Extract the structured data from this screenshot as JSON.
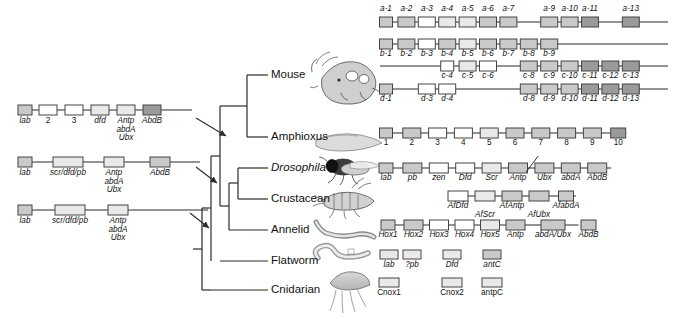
{
  "figure": {
    "colors": {
      "line": "#2b2b2b",
      "box_stroke": "#444444",
      "box_fill_light": "#ffffff",
      "box_fill_pale": "#e9e9e9",
      "box_fill_mid": "#c9c9c9",
      "box_fill_dark": "#9a9a9a",
      "text": "#111111"
    }
  },
  "tree": {
    "taxa": [
      {
        "label": "Mouse",
        "italic": false
      },
      {
        "label": "Amphioxus",
        "italic": false
      },
      {
        "label": "Drosophila",
        "italic": true
      },
      {
        "label": "Crustacean",
        "italic": false
      },
      {
        "label": "Annelid",
        "italic": false
      },
      {
        "label": "Flatworm",
        "italic": false
      },
      {
        "label": "Cnidarian",
        "italic": false
      }
    ],
    "node_arrows": 3
  },
  "ancestral_clusters": [
    {
      "name": "ancestral-cluster-1",
      "genes": [
        {
          "label": "lab",
          "shade": "mid",
          "italic": true
        },
        {
          "label": "2",
          "shade": "light",
          "italic": false
        },
        {
          "label": "3",
          "shade": "light",
          "italic": false
        },
        {
          "label": "dfd",
          "shade": "pale",
          "italic": true
        },
        {
          "label": "Antp\nabdA\nUbx",
          "shade": "pale",
          "italic": true
        },
        {
          "label": "AbdB",
          "shade": "dark",
          "italic": true
        }
      ]
    },
    {
      "name": "ancestral-cluster-2",
      "genes": [
        {
          "label": "lab",
          "shade": "mid",
          "italic": true
        },
        {
          "label": "scr/dfd/pb",
          "shade": "pale",
          "italic": true
        },
        {
          "label": "Antp\nabdA\nUbx",
          "shade": "pale",
          "italic": true
        },
        {
          "label": "AbdB",
          "shade": "mid",
          "italic": true
        }
      ]
    },
    {
      "name": "ancestral-cluster-3",
      "genes": [
        {
          "label": "lab",
          "shade": "mid",
          "italic": true
        },
        {
          "label": "scr/dfd/pb",
          "shade": "pale",
          "italic": true
        },
        {
          "label": "Antp\nabdA\nUbx",
          "shade": "pale",
          "italic": true
        }
      ]
    }
  ],
  "extant_clusters": {
    "mouse": [
      {
        "name": "hox-a",
        "labels_above": true,
        "genes": [
          {
            "label": "a-1",
            "slot": 1,
            "shade": "mid"
          },
          {
            "label": "a-2",
            "slot": 2,
            "shade": "mid"
          },
          {
            "label": "a-3",
            "slot": 3,
            "shade": "light"
          },
          {
            "label": "a-4",
            "slot": 4,
            "shade": "pale"
          },
          {
            "label": "a-5",
            "slot": 5,
            "shade": "pale"
          },
          {
            "label": "a-6",
            "slot": 6,
            "shade": "mid"
          },
          {
            "label": "a-7",
            "slot": 7,
            "shade": "mid"
          },
          {
            "label": "a-9",
            "slot": 9,
            "shade": "mid"
          },
          {
            "label": "a-10",
            "slot": 10,
            "shade": "mid"
          },
          {
            "label": "a-11",
            "slot": 11,
            "shade": "dark"
          },
          {
            "label": "a-13",
            "slot": 13,
            "shade": "dark"
          }
        ]
      },
      {
        "name": "hox-b",
        "labels_above": false,
        "genes": [
          {
            "label": "b-1",
            "slot": 1,
            "shade": "mid"
          },
          {
            "label": "b-2",
            "slot": 2,
            "shade": "mid"
          },
          {
            "label": "b-3",
            "slot": 3,
            "shade": "light"
          },
          {
            "label": "b-4",
            "slot": 4,
            "shade": "mid"
          },
          {
            "label": "b-5",
            "slot": 5,
            "shade": "pale"
          },
          {
            "label": "b-6",
            "slot": 6,
            "shade": "mid"
          },
          {
            "label": "b-7",
            "slot": 7,
            "shade": "mid"
          },
          {
            "label": "b-8",
            "slot": 8,
            "shade": "mid"
          },
          {
            "label": "b-9",
            "slot": 9,
            "shade": "mid"
          }
        ]
      },
      {
        "name": "hox-c",
        "labels_above": false,
        "genes": [
          {
            "label": "c-4",
            "slot": 4,
            "shade": "light"
          },
          {
            "label": "c-5",
            "slot": 5,
            "shade": "pale"
          },
          {
            "label": "c-6",
            "slot": 6,
            "shade": "light"
          },
          {
            "label": "c-8",
            "slot": 8,
            "shade": "mid"
          },
          {
            "label": "c-9",
            "slot": 9,
            "shade": "mid"
          },
          {
            "label": "c-10",
            "slot": 10,
            "shade": "mid"
          },
          {
            "label": "c-11",
            "slot": 11,
            "shade": "dark"
          },
          {
            "label": "c-12",
            "slot": 12,
            "shade": "dark"
          },
          {
            "label": "c-13",
            "slot": 13,
            "shade": "dark"
          }
        ]
      },
      {
        "name": "hox-d",
        "labels_above": false,
        "genes": [
          {
            "label": "d-1",
            "slot": 1,
            "shade": "mid"
          },
          {
            "label": "d-3",
            "slot": 3,
            "shade": "light"
          },
          {
            "label": "d-4",
            "slot": 4,
            "shade": "light"
          },
          {
            "label": "d-8",
            "slot": 8,
            "shade": "mid"
          },
          {
            "label": "d-9",
            "slot": 9,
            "shade": "mid"
          },
          {
            "label": "d-10",
            "slot": 10,
            "shade": "mid"
          },
          {
            "label": "d-11",
            "slot": 11,
            "shade": "dark"
          },
          {
            "label": "d-12",
            "slot": 12,
            "shade": "dark"
          },
          {
            "label": "d-13",
            "slot": 13,
            "shade": "dark"
          }
        ]
      }
    ],
    "amphioxus": {
      "name": "amphioxus-cluster",
      "genes": [
        {
          "label": "1",
          "shade": "mid",
          "italic": false
        },
        {
          "label": "2",
          "shade": "mid",
          "italic": false
        },
        {
          "label": "3",
          "shade": "light",
          "italic": false
        },
        {
          "label": "4",
          "shade": "light",
          "italic": false
        },
        {
          "label": "5",
          "shade": "pale",
          "italic": false
        },
        {
          "label": "6",
          "shade": "mid",
          "italic": false
        },
        {
          "label": "7",
          "shade": "mid",
          "italic": false
        },
        {
          "label": "8",
          "shade": "mid",
          "italic": false
        },
        {
          "label": "9",
          "shade": "mid",
          "italic": false
        },
        {
          "label": "10",
          "shade": "dark",
          "italic": false
        }
      ]
    },
    "drosophila": {
      "name": "drosophila-cluster",
      "split_after": "Antp",
      "genes": [
        {
          "label": "lab",
          "shade": "mid"
        },
        {
          "label": "pb",
          "shade": "mid"
        },
        {
          "label": "zen",
          "shade": "light"
        },
        {
          "label": "Dfd",
          "shade": "light"
        },
        {
          "label": "Scr",
          "shade": "pale"
        },
        {
          "label": "Antp",
          "shade": "mid"
        },
        {
          "label": "Ubx",
          "shade": "mid"
        },
        {
          "label": "abdA",
          "shade": "mid"
        },
        {
          "label": "AbdB",
          "shade": "mid"
        }
      ]
    },
    "crustacean": {
      "name": "crustacean-cluster",
      "genes": [
        {
          "label": "AfDfd",
          "shade": "light",
          "row": 0
        },
        {
          "label": "AfScr",
          "shade": "pale",
          "row": 1
        },
        {
          "label": "AfAntp",
          "shade": "mid",
          "row": 0
        },
        {
          "label": "AfUbx",
          "shade": "mid",
          "row": 1
        },
        {
          "label": "AfabdA",
          "shade": "mid",
          "row": 0
        }
      ]
    },
    "annelid": {
      "name": "annelid-cluster",
      "genes": [
        {
          "label": "Hox1",
          "shade": "mid"
        },
        {
          "label": "Hox2",
          "shade": "mid"
        },
        {
          "label": "Hox3",
          "shade": "light"
        },
        {
          "label": "Hox4",
          "shade": "light"
        },
        {
          "label": "Hox5",
          "shade": "pale"
        },
        {
          "label": "Antp",
          "shade": "mid"
        },
        {
          "label": "abdA/Ubx",
          "shade": "mid"
        },
        {
          "label": "AbdB",
          "shade": "mid"
        }
      ]
    },
    "flatworm": {
      "name": "flatworm-genes",
      "linked": false,
      "genes": [
        {
          "label": "lab",
          "shade": "pale"
        },
        {
          "label": "?pb",
          "shade": "pale"
        },
        {
          "label": "Dfd",
          "shade": "pale"
        },
        {
          "label": "antC",
          "shade": "mid"
        }
      ]
    },
    "cnidarian": {
      "name": "cnidarian-genes",
      "linked": false,
      "genes": [
        {
          "label": "Cnox1",
          "shade": "pale"
        },
        {
          "label": "Cnox2",
          "shade": "pale"
        },
        {
          "label": "antpC",
          "shade": "pale"
        }
      ]
    }
  },
  "organism_icons": [
    {
      "name": "mouse-illustration",
      "taxon": "Mouse"
    },
    {
      "name": "amphioxus-illustration",
      "taxon": "Amphioxus"
    },
    {
      "name": "drosophila-illustration",
      "taxon": "Drosophila"
    },
    {
      "name": "crustacean-illustration",
      "taxon": "Crustacean"
    },
    {
      "name": "annelid-illustration",
      "taxon": "Annelid"
    },
    {
      "name": "flatworm-illustration",
      "taxon": "Flatworm"
    },
    {
      "name": "cnidarian-illustration",
      "taxon": "Cnidarian"
    }
  ]
}
